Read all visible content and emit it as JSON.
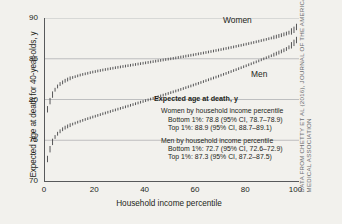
{
  "axes": {
    "ylabel": "Expected age at death for 40-year-olds, y",
    "xlabel": "Household income percentile",
    "yticks": [
      "90",
      "85",
      "80",
      "75",
      "70"
    ],
    "xticks": [
      "0",
      "20",
      "40",
      "60",
      "80",
      "100"
    ]
  },
  "series_labels": {
    "women": "Women",
    "men": "Men"
  },
  "legend": {
    "title": "Expected age at death, y",
    "women_head": "Women by household income percentile",
    "women_bottom": "Bottom 1%: 78.8 (95% CI, 78.7–78.9)",
    "women_top": "Top 1%: 88.9 (95% CI, 88.7–89.1)",
    "men_head": "Men by household income percentile",
    "men_bottom": "Bottom 1%: 72.7 (95% CI, 72.6–72.9)",
    "men_top": "Top 1%: 87.3 (95% CI, 87.2–87.5)"
  },
  "credit": "DATA FROM CHETTY ET AL (2016), JOURNAL OF THE AMERICAN MEDICAL ASSOCIATION",
  "colors": {
    "background": "#f2f1ed",
    "axis": "#58595b",
    "grid": "#a7a9ac",
    "marker": "#3b3b3d",
    "text": "#231f20",
    "credit_text": "#6d6e71"
  },
  "chart_data": {
    "type": "scatter",
    "title": "",
    "xlabel": "Household income percentile",
    "ylabel": "Expected age at death for 40-year-olds, y",
    "xlim": [
      0,
      101
    ],
    "ylim": [
      70,
      90
    ],
    "grid": true,
    "grid_axis": "y",
    "gridlines": [
      70,
      75,
      80,
      85,
      90
    ],
    "legend_position": "inside-lower-right",
    "marker_style": "vertical-error-bar",
    "x": [
      1,
      2,
      3,
      4,
      5,
      6,
      7,
      8,
      9,
      10,
      11,
      12,
      13,
      14,
      15,
      16,
      17,
      18,
      19,
      20,
      21,
      22,
      23,
      24,
      25,
      26,
      27,
      28,
      29,
      30,
      31,
      32,
      33,
      34,
      35,
      36,
      37,
      38,
      39,
      40,
      41,
      42,
      43,
      44,
      45,
      46,
      47,
      48,
      49,
      50,
      51,
      52,
      53,
      54,
      55,
      56,
      57,
      58,
      59,
      60,
      61,
      62,
      63,
      64,
      65,
      66,
      67,
      68,
      69,
      70,
      71,
      72,
      73,
      74,
      75,
      76,
      77,
      78,
      79,
      80,
      81,
      82,
      83,
      84,
      85,
      86,
      87,
      88,
      89,
      90,
      91,
      92,
      93,
      94,
      95,
      96,
      97,
      98,
      99,
      100
    ],
    "series": [
      {
        "name": "Women",
        "label": "Women",
        "bottom_1pct": 78.8,
        "bottom_1pct_ci": [
          78.7,
          78.9
        ],
        "top_1pct": 88.9,
        "top_1pct_ci": [
          88.7,
          89.1
        ],
        "values": [
          78.8,
          79.8,
          80.6,
          81.2,
          81.6,
          81.9,
          82.1,
          82.3,
          82.45,
          82.6,
          82.7,
          82.8,
          82.9,
          83.0,
          83.08,
          83.15,
          83.22,
          83.3,
          83.37,
          83.43,
          83.5,
          83.56,
          83.62,
          83.68,
          83.73,
          83.79,
          83.84,
          83.9,
          83.95,
          84.0,
          84.05,
          84.1,
          84.15,
          84.2,
          84.25,
          84.3,
          84.35,
          84.4,
          84.45,
          84.5,
          84.55,
          84.6,
          84.65,
          84.7,
          84.75,
          84.8,
          84.85,
          84.9,
          84.95,
          85.0,
          85.05,
          85.1,
          85.16,
          85.21,
          85.26,
          85.32,
          85.37,
          85.43,
          85.48,
          85.54,
          85.6,
          85.65,
          85.71,
          85.77,
          85.83,
          85.89,
          85.95,
          86.01,
          86.07,
          86.13,
          86.2,
          86.26,
          86.32,
          86.39,
          86.45,
          86.52,
          86.59,
          86.65,
          86.72,
          86.79,
          86.86,
          86.93,
          87.0,
          87.08,
          87.15,
          87.23,
          87.3,
          87.38,
          87.46,
          87.54,
          87.63,
          87.71,
          87.8,
          87.89,
          87.99,
          88.09,
          88.2,
          88.35,
          88.55,
          88.9
        ]
      },
      {
        "name": "Men",
        "label": "Men",
        "bottom_1pct": 72.7,
        "bottom_1pct_ci": [
          72.6,
          72.9
        ],
        "top_1pct": 87.3,
        "top_1pct_ci": [
          87.2,
          87.5
        ],
        "values": [
          72.7,
          73.9,
          74.8,
          75.4,
          75.8,
          76.1,
          76.35,
          76.55,
          76.7,
          76.85,
          76.98,
          77.1,
          77.22,
          77.33,
          77.44,
          77.55,
          77.65,
          77.75,
          77.85,
          77.95,
          78.05,
          78.15,
          78.25,
          78.34,
          78.44,
          78.53,
          78.63,
          78.72,
          78.82,
          78.91,
          79.0,
          79.1,
          79.19,
          79.29,
          79.38,
          79.48,
          79.57,
          79.67,
          79.76,
          79.86,
          79.95,
          80.05,
          80.15,
          80.24,
          80.34,
          80.44,
          80.54,
          80.64,
          80.74,
          80.84,
          80.94,
          81.04,
          81.14,
          81.24,
          81.35,
          81.45,
          81.56,
          81.66,
          81.77,
          81.88,
          81.98,
          82.09,
          82.2,
          82.31,
          82.42,
          82.53,
          82.64,
          82.75,
          82.86,
          82.98,
          83.09,
          83.2,
          83.32,
          83.43,
          83.55,
          83.66,
          83.78,
          83.9,
          84.02,
          84.14,
          84.26,
          84.38,
          84.5,
          84.62,
          84.74,
          84.87,
          84.99,
          85.12,
          85.24,
          85.37,
          85.5,
          85.63,
          85.76,
          85.9,
          86.04,
          86.2,
          86.4,
          86.65,
          86.95,
          87.3
        ]
      }
    ]
  }
}
